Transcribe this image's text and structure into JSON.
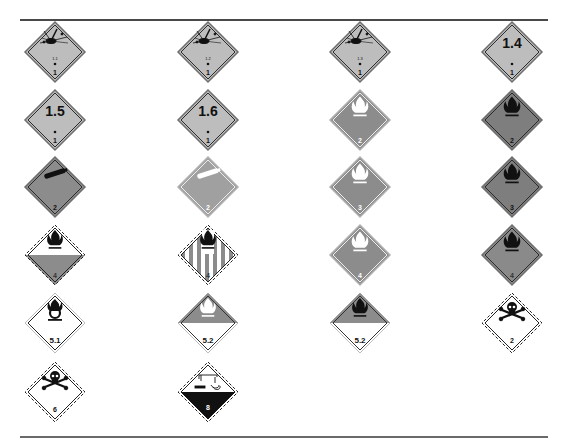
{
  "page": {
    "colors": {
      "gray_light": "#b9b9b9",
      "gray_mid": "#8c8c8c",
      "gray_dark": "#7a7a7a",
      "black": "#111111",
      "white": "#ffffff",
      "rule": "#4a4a4a"
    }
  },
  "labels": [
    {
      "id": "1.1",
      "col": 0,
      "row": 0,
      "symbol": "explosion",
      "division_text": "1.1",
      "class_number": "1",
      "style": "explosive",
      "bg": "#bdbdbd",
      "symbol_color": "#111111",
      "text_color": "#111111"
    },
    {
      "id": "1.2",
      "col": 1,
      "row": 0,
      "symbol": "explosion",
      "division_text": "1.2",
      "class_number": "1",
      "style": "explosive",
      "bg": "#bdbdbd",
      "symbol_color": "#111111",
      "text_color": "#111111"
    },
    {
      "id": "1.3",
      "col": 2,
      "row": 0,
      "symbol": "explosion",
      "division_text": "1.3",
      "class_number": "1",
      "style": "explosive",
      "bg": "#bdbdbd",
      "symbol_color": "#111111",
      "text_color": "#111111"
    },
    {
      "id": "1.4",
      "col": 3,
      "row": 0,
      "symbol": "none",
      "division_text": "1.4",
      "class_number": "1",
      "style": "explosive-number",
      "bg": "#bdbdbd",
      "symbol_color": "#111111",
      "text_color": "#111111"
    },
    {
      "id": "1.5",
      "col": 0,
      "row": 1,
      "symbol": "none",
      "division_text": "1.5",
      "class_number": "1",
      "style": "explosive-number",
      "bg": "#bdbdbd",
      "symbol_color": "#111111",
      "text_color": "#111111"
    },
    {
      "id": "1.6",
      "col": 1,
      "row": 1,
      "symbol": "none",
      "division_text": "1.6",
      "class_number": "1",
      "style": "explosive-number",
      "bg": "#bdbdbd",
      "symbol_color": "#111111",
      "text_color": "#111111"
    },
    {
      "id": "2.1-white",
      "col": 2,
      "row": 1,
      "symbol": "flame",
      "division_text": "",
      "class_number": "2",
      "style": "solid",
      "bg": "#8c8c8c",
      "symbol_color": "#ffffff",
      "text_color": "#ffffff"
    },
    {
      "id": "2.1-black",
      "col": 3,
      "row": 1,
      "symbol": "flame",
      "division_text": "",
      "class_number": "2",
      "style": "solid-dark-border",
      "bg": "#7e7e7e",
      "symbol_color": "#111111",
      "text_color": "#111111"
    },
    {
      "id": "2.2-black",
      "col": 0,
      "row": 2,
      "symbol": "cylinder",
      "division_text": "",
      "class_number": "2",
      "style": "solid-dark-border",
      "bg": "#8c8c8c",
      "symbol_color": "#111111",
      "text_color": "#111111"
    },
    {
      "id": "2.2-white",
      "col": 1,
      "row": 2,
      "symbol": "cylinder",
      "division_text": "",
      "class_number": "2",
      "style": "solid",
      "bg": "#a0a0a0",
      "symbol_color": "#ffffff",
      "text_color": "#ffffff"
    },
    {
      "id": "3-white",
      "col": 2,
      "row": 2,
      "symbol": "flame",
      "division_text": "",
      "class_number": "3",
      "style": "solid",
      "bg": "#8c8c8c",
      "symbol_color": "#ffffff",
      "text_color": "#ffffff"
    },
    {
      "id": "3-black",
      "col": 3,
      "row": 2,
      "symbol": "flame",
      "division_text": "",
      "class_number": "3",
      "style": "solid-dark-border",
      "bg": "#7e7e7e",
      "symbol_color": "#111111",
      "text_color": "#111111"
    },
    {
      "id": "4.3",
      "col": 0,
      "row": 3,
      "symbol": "flame",
      "division_text": "",
      "class_number": "4",
      "style": "half-white-top",
      "bg": "#8c8c8c",
      "symbol_color": "#111111",
      "text_color": "#333333"
    },
    {
      "id": "4.1",
      "col": 1,
      "row": 3,
      "symbol": "flame",
      "division_text": "",
      "class_number": "4",
      "style": "striped",
      "bg": "#ffffff",
      "symbol_color": "#111111",
      "text_color": "#333333"
    },
    {
      "id": "4.2-white",
      "col": 2,
      "row": 3,
      "symbol": "flame",
      "division_text": "",
      "class_number": "4",
      "style": "solid",
      "bg": "#8c8c8c",
      "symbol_color": "#ffffff",
      "text_color": "#ffffff"
    },
    {
      "id": "4.2-black",
      "col": 3,
      "row": 3,
      "symbol": "flame",
      "division_text": "",
      "class_number": "4",
      "style": "solid-dark-border",
      "bg": "#8a8a8a",
      "symbol_color": "#111111",
      "text_color": "#333333"
    },
    {
      "id": "5.1",
      "col": 0,
      "row": 4,
      "symbol": "flame-over-circle",
      "division_text": "",
      "class_number": "5.1",
      "style": "white",
      "bg": "#ffffff",
      "symbol_color": "#111111",
      "text_color": "#111111"
    },
    {
      "id": "5.2-white",
      "col": 1,
      "row": 4,
      "symbol": "flame",
      "division_text": "",
      "class_number": "5.2",
      "style": "half-gray-top",
      "bg": "#8c8c8c",
      "symbol_color": "#ffffff",
      "text_color": "#111111"
    },
    {
      "id": "5.2-black",
      "col": 2,
      "row": 4,
      "symbol": "flame",
      "division_text": "",
      "class_number": "5.2",
      "style": "half-gray-top",
      "bg": "#8c8c8c",
      "symbol_color": "#111111",
      "text_color": "#111111"
    },
    {
      "id": "2.3",
      "col": 3,
      "row": 4,
      "symbol": "skull",
      "division_text": "",
      "class_number": "2",
      "style": "white-dashed",
      "bg": "#ffffff",
      "symbol_color": "#111111",
      "text_color": "#111111"
    },
    {
      "id": "6.1",
      "col": 0,
      "row": 5,
      "symbol": "skull",
      "division_text": "",
      "class_number": "6",
      "style": "white-dashed",
      "bg": "#ffffff",
      "symbol_color": "#111111",
      "text_color": "#111111"
    },
    {
      "id": "8",
      "col": 1,
      "row": 5,
      "symbol": "corrosion",
      "division_text": "",
      "class_number": "8",
      "style": "half-black-bottom",
      "bg": "#111111",
      "symbol_color": "#111111",
      "text_color": "#ffffff"
    }
  ],
  "layout": {
    "col_centers": [
      55,
      208,
      360,
      512
    ],
    "row_centers": [
      52,
      120,
      187,
      255,
      323,
      392
    ]
  }
}
